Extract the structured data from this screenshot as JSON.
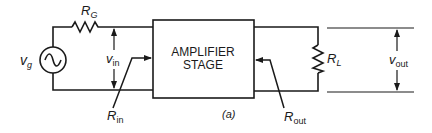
{
  "diagram": {
    "caption": "(a)",
    "amplifier": {
      "line1": "AMPLIFIER",
      "line2": "STAGE"
    },
    "source": {
      "symbol": "v",
      "sub": "g"
    },
    "source_resistor": {
      "symbol": "R",
      "sub": "G"
    },
    "load_resistor": {
      "symbol": "R",
      "sub": "L"
    },
    "input_voltage": {
      "symbol": "v",
      "sub": "in"
    },
    "output_voltage": {
      "symbol": "v",
      "sub": "out"
    },
    "input_resistance": {
      "symbol": "R",
      "sub": "in"
    },
    "output_resistance": {
      "symbol": "R",
      "sub": "out"
    },
    "colors": {
      "line": "#1a1a1a",
      "background": "#ffffff"
    }
  }
}
